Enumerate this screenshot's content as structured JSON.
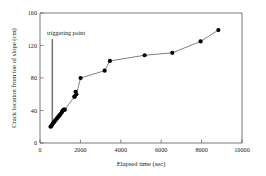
{
  "chart_data": {
    "type": "scatter",
    "title": "",
    "xlabel": "Elapsed time (sec)",
    "ylabel": "Crack location from toe of slope (cm)",
    "xlim": [
      0,
      10000
    ],
    "ylim": [
      0,
      160
    ],
    "xticks": [
      0,
      2000,
      4000,
      6000,
      8000,
      10000
    ],
    "yticks": [
      0,
      40,
      80,
      120,
      160
    ],
    "xtick_labels": [
      "0",
      "2000",
      "4000",
      "6000",
      "8000",
      "10000"
    ],
    "ytick_labels": [
      "0",
      "40",
      "80",
      "120",
      "160"
    ],
    "grid": false,
    "legend": null,
    "marker": "filled-circle",
    "line_style": "solid-connecting",
    "series": [
      {
        "name": "Crack location",
        "x": [
          520,
          560,
          600,
          640,
          690,
          730,
          780,
          830,
          880,
          930,
          980,
          1030,
          1080,
          1130,
          1160,
          1180,
          1230,
          1700,
          1720,
          1760,
          1800,
          2010,
          3200,
          3460,
          5180,
          6550,
          7950,
          8830
        ],
        "y": [
          20,
          21,
          22.5,
          24,
          25.5,
          27,
          28.5,
          30,
          31.5,
          33,
          34.5,
          36,
          38,
          40,
          40.5,
          41,
          41,
          57,
          57,
          63,
          60,
          80,
          89,
          101,
          108,
          111,
          125,
          139
        ]
      }
    ],
    "annotations": [
      {
        "name": "triggering point",
        "label": "triggering point",
        "x": 610,
        "y_top": 128,
        "y_bottom": 18,
        "color": "#7a7a7a"
      }
    ]
  },
  "axes": {
    "x_title": "Elapsed time (sec)",
    "y_title": "Crack location from toe of slope (cm)"
  },
  "colors": {
    "marker": "#000000",
    "line": "#4a4a4a",
    "axis": "#555555",
    "annotation": "#7a7a7a",
    "background": "#ffffff"
  }
}
